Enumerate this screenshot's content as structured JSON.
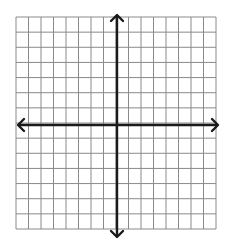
{
  "diagram": {
    "type": "coordinate-grid",
    "colors": {
      "background": "#ffffff",
      "grid_line": "#8a8a8a",
      "axis": "#1a1a1a"
    },
    "grid": {
      "left": 16,
      "top": 17,
      "right": 216,
      "bottom": 229,
      "columns": 16,
      "rows": 14
    },
    "axes": {
      "x_axis": {
        "y": 125,
        "from": 18,
        "to": 218,
        "arrows": [
          "left",
          "right"
        ]
      },
      "y_axis": {
        "x": 117,
        "from": 15,
        "to": 237,
        "arrows": [
          "up",
          "down"
        ]
      }
    },
    "labels": []
  }
}
